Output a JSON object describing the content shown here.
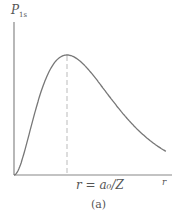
{
  "chart_data": {
    "type": "line",
    "title": "",
    "caption": "(a)",
    "ylabel": "P",
    "ylabel_subscript": "1s",
    "xlabel": "r",
    "annotation": "r = a₀/Z",
    "annotation_position": "dashed vertical line at curve maximum",
    "grid": false,
    "legend": null,
    "x": [
      0,
      0.25,
      0.5,
      0.75,
      1.0,
      1.25,
      1.5,
      1.75,
      2.0,
      2.5,
      3.0,
      3.5,
      4.0,
      4.5,
      5.0
    ],
    "series": [
      {
        "name": "P_1s",
        "values": [
          0,
          0.4,
          0.73,
          0.93,
          1.0,
          0.95,
          0.84,
          0.7,
          0.56,
          0.34,
          0.18,
          0.09,
          0.05,
          0.025,
          0.012
        ],
        "color": "#777777"
      }
    ],
    "xlim": [
      0,
      5
    ],
    "ylim": [
      0,
      1.5
    ]
  },
  "labels": {
    "ylabel": "P",
    "ylabel_sub": "1s",
    "xlabel": "r",
    "peak": "r = a₀/Z",
    "caption": "(a)"
  }
}
